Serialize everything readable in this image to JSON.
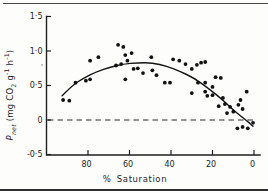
{
  "chart_data": {
    "type": "scatter",
    "title": "",
    "xlabel": "% Saturation",
    "ylabel": "Pnet (mg CO2 g-1 h-1)",
    "ylabel_parts": {
      "p": "P",
      "p_sub": "net",
      "seg1": " (mg CO",
      "co2_sub": "2",
      "seg2": " g",
      "g_sup": "-1",
      "seg3": " h",
      "h_sup": "-1",
      "seg4": ")"
    },
    "x_axis": {
      "reversed": true,
      "range": [
        100,
        0
      ],
      "ticks": [
        80,
        60,
        40,
        20,
        0
      ],
      "tick_labels": [
        "80",
        "60",
        "40",
        "20",
        "0"
      ]
    },
    "y_axis": {
      "range": [
        -0.5,
        1.5
      ],
      "ticks": [
        1.5,
        1.0,
        0.5,
        0,
        -0.5
      ],
      "tick_labels": [
        "1·5",
        "1·0",
        "0·5",
        "0",
        "-0·5"
      ]
    },
    "zero_line": {
      "y": 0,
      "style": "dashed"
    },
    "grid": false,
    "legend": false,
    "points": [
      [
        92,
        0.29
      ],
      [
        89,
        0.28
      ],
      [
        86,
        0.54
      ],
      [
        81,
        0.57
      ],
      [
        79,
        0.59
      ],
      [
        79,
        0.86
      ],
      [
        75,
        0.91
      ],
      [
        65.5,
        1.09
      ],
      [
        63,
        1.06
      ],
      [
        62,
        0.94
      ],
      [
        59,
        0.97
      ],
      [
        61,
        0.86
      ],
      [
        64,
        0.81
      ],
      [
        66.5,
        0.79
      ],
      [
        58,
        0.74
      ],
      [
        62,
        0.59
      ],
      [
        56,
        0.75
      ],
      [
        53.5,
        0.68
      ],
      [
        49.5,
        0.91
      ],
      [
        49,
        0.72
      ],
      [
        47,
        0.65
      ],
      [
        43,
        0.54
      ],
      [
        40.5,
        0.54
      ],
      [
        39,
        0.88
      ],
      [
        36,
        0.86
      ],
      [
        33,
        0.81
      ],
      [
        30,
        0.74
      ],
      [
        27.5,
        0.8
      ],
      [
        25.5,
        0.83
      ],
      [
        23.5,
        0.84
      ],
      [
        27,
        0.54
      ],
      [
        23.5,
        0.54
      ],
      [
        20,
        0.48
      ],
      [
        18.5,
        0.62
      ],
      [
        16,
        0.61
      ],
      [
        30,
        0.39
      ],
      [
        23.5,
        0.41
      ],
      [
        22.5,
        0.35
      ],
      [
        20,
        0.36
      ],
      [
        17,
        0.2
      ],
      [
        15,
        0.32
      ],
      [
        14,
        0.23
      ],
      [
        13,
        0.1
      ],
      [
        11.5,
        0.19
      ],
      [
        10,
        0.12
      ],
      [
        3.5,
        0.41
      ],
      [
        6.5,
        0.29
      ],
      [
        7.5,
        0.22
      ],
      [
        5.5,
        0.16
      ],
      [
        8,
        -0.12
      ],
      [
        5.5,
        -0.1
      ],
      [
        3,
        -0.12
      ],
      [
        0.5,
        -0.04
      ]
    ],
    "curve": [
      [
        92.5,
        0.35
      ],
      [
        88,
        0.49
      ],
      [
        82,
        0.61
      ],
      [
        76,
        0.7
      ],
      [
        69,
        0.77
      ],
      [
        63,
        0.81
      ],
      [
        56,
        0.83
      ],
      [
        49,
        0.83
      ],
      [
        42,
        0.78
      ],
      [
        36,
        0.71
      ],
      [
        29,
        0.61
      ],
      [
        22,
        0.46
      ],
      [
        15,
        0.29
      ],
      [
        9,
        0.12
      ],
      [
        3.5,
        -0.01
      ],
      [
        0.5,
        -0.09
      ]
    ],
    "colors": {
      "ink": "#141414",
      "paper": "#fdfdfc"
    }
  }
}
